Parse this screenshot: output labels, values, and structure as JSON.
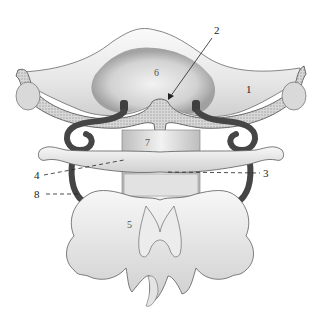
{
  "figure": {
    "labels": [
      {
        "id": "1",
        "text": "1",
        "x": 246,
        "y": 84
      },
      {
        "id": "2",
        "text": "2",
        "x": 214,
        "y": 25
      },
      {
        "id": "3",
        "text": "3",
        "x": 263,
        "y": 168
      },
      {
        "id": "4",
        "text": "4",
        "x": 34,
        "y": 170
      },
      {
        "id": "5",
        "text": "5",
        "x": 127,
        "y": 220
      },
      {
        "id": "6",
        "text": "6",
        "x": 154,
        "y": 68
      },
      {
        "id": "7",
        "text": "7",
        "x": 145,
        "y": 138
      },
      {
        "id": "8",
        "text": "8",
        "x": 34,
        "y": 189
      }
    ],
    "colors": {
      "background": "#ffffff",
      "bone_light": "#f2f2f2",
      "bone_mid": "#d4d4d4",
      "bone_dark": "#8a8a8a",
      "outline": "#5a5a5a",
      "artery": "#4a4a4a",
      "cancellous": "#bdbdbd"
    }
  }
}
